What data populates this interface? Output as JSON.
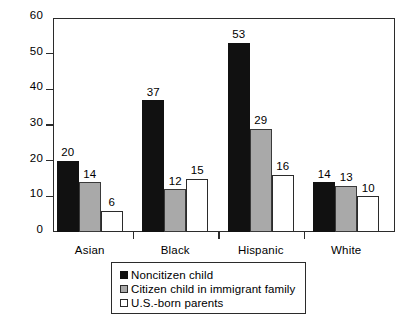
{
  "chart_data": {
    "type": "bar",
    "title": "",
    "subtitle": "",
    "xlabel": "",
    "ylabel": "",
    "categories": [
      "Asian",
      "Black",
      "Hispanic",
      "White"
    ],
    "series": [
      {
        "name": "Noncitizen child",
        "values": [
          20,
          37,
          53,
          14
        ],
        "color": "#111111"
      },
      {
        "name": "Citizen child in immigrant family",
        "values": [
          14,
          12,
          29,
          13
        ],
        "color": "#a9a9a9"
      },
      {
        "name": "U.S.-born parents",
        "values": [
          6,
          15,
          16,
          10
        ],
        "color": "#ffffff"
      }
    ],
    "ylim": [
      0,
      60
    ],
    "yticks": [
      0,
      10,
      20,
      30,
      40,
      50,
      60
    ],
    "ytick_labels": [
      "0",
      "10",
      "20",
      "30",
      "40",
      "50",
      "60"
    ],
    "grid": false,
    "data_labels": true,
    "legend_position": "bottom-center",
    "frame": true
  },
  "legend": {
    "entries": [
      {
        "label": "Noncitizen child",
        "swatch": "black-square-icon"
      },
      {
        "label": "Citizen child in immigrant family",
        "swatch": "gray-square-icon"
      },
      {
        "label": "U.S.-born parents",
        "swatch": "white-square-icon"
      }
    ]
  }
}
